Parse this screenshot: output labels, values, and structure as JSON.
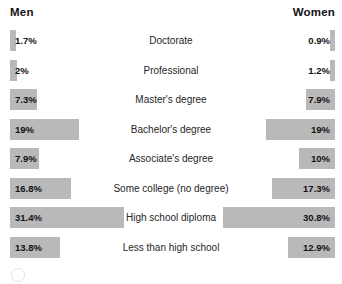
{
  "header": {
    "left_label": "Men",
    "right_label": "Women"
  },
  "chart_data": {
    "type": "bar",
    "title": "",
    "subtitle": "",
    "xlabel": "",
    "ylabel": "",
    "orientation": "horizontal",
    "layout": "diverging-tornado",
    "grid": false,
    "legend_position": "top",
    "axis_range_percent": [
      0,
      31.4
    ],
    "categories": [
      "Doctorate",
      "Professional",
      "Master's degree",
      "Bachelor's  degree",
      "Associate's degree",
      "Some college (no degree)",
      "High school diploma",
      "Less than high school"
    ],
    "series": [
      {
        "name": "Men",
        "side": "left",
        "values": [
          1.7,
          2,
          7.3,
          19,
          7.9,
          16.8,
          31.4,
          13.8
        ],
        "labels": [
          "1.7%",
          "2%",
          "7.3%",
          "19%",
          "7.9%",
          "16.8%",
          "31.4%",
          "13.8%"
        ]
      },
      {
        "name": "Women",
        "side": "right",
        "values": [
          0.9,
          1.2,
          7.9,
          19,
          10,
          17.3,
          30.8,
          12.9
        ],
        "labels": [
          "0.9%",
          "1.2%",
          "7.9%",
          "19%",
          "10%",
          "17.3%",
          "30.8%",
          "12.9%"
        ]
      }
    ],
    "bar_color": "#b9b9b9",
    "background_color": "#ffffff"
  }
}
